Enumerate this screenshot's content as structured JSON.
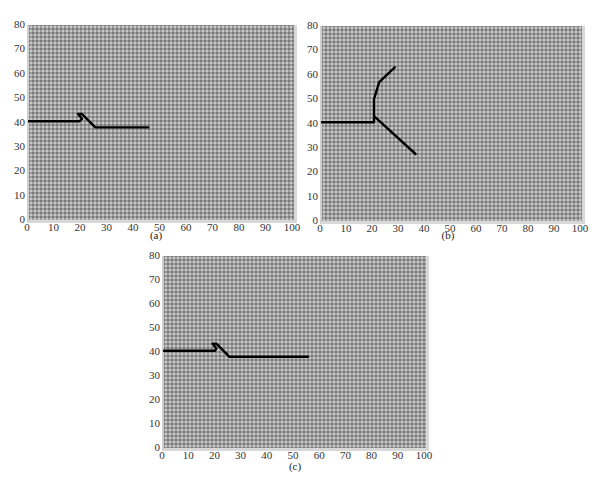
{
  "chart_data": [
    {
      "type": "line",
      "panel": "a",
      "caption": "(a)",
      "xlim": [
        0,
        100
      ],
      "ylim": [
        0,
        80
      ],
      "xticks": [
        "0",
        "10",
        "20",
        "30",
        "40",
        "50",
        "60",
        "70",
        "80",
        "90",
        "100"
      ],
      "yticks": [
        "0",
        "10",
        "20",
        "30",
        "40",
        "50",
        "60",
        "70",
        "80"
      ],
      "grid": "dotted texture background",
      "series": [
        {
          "name": "crack-path",
          "points": [
            [
              0,
              40.5
            ],
            [
              19,
              40.5
            ],
            [
              20,
              41.5
            ],
            [
              18.5,
              43.5
            ],
            [
              20,
              43.5
            ],
            [
              25,
              38
            ],
            [
              45,
              38
            ]
          ]
        }
      ]
    },
    {
      "type": "line",
      "panel": "b",
      "caption": "(b)",
      "xlim": [
        0,
        100
      ],
      "ylim": [
        0,
        80
      ],
      "xticks": [
        "0",
        "10",
        "20",
        "30",
        "40",
        "50",
        "60",
        "70",
        "80",
        "90",
        "100"
      ],
      "yticks": [
        "0",
        "10",
        "20",
        "30",
        "40",
        "50",
        "60",
        "70",
        "80"
      ],
      "grid": "dotted texture background",
      "series": [
        {
          "name": "main-branch",
          "points": [
            [
              0,
              40.5
            ],
            [
              20,
              40.5
            ],
            [
              20,
              50
            ],
            [
              22,
              57
            ],
            [
              28,
              63
            ]
          ]
        },
        {
          "name": "lower-branch",
          "points": [
            [
              20,
              43
            ],
            [
              36,
              27.5
            ]
          ]
        }
      ]
    },
    {
      "type": "line",
      "panel": "c",
      "caption": "(c)",
      "xlim": [
        0,
        100
      ],
      "ylim": [
        0,
        80
      ],
      "xticks": [
        "0",
        "10",
        "20",
        "30",
        "40",
        "50",
        "60",
        "70",
        "80",
        "90",
        "100"
      ],
      "yticks": [
        "0",
        "10",
        "20",
        "30",
        "40",
        "50",
        "60",
        "70",
        "80"
      ],
      "grid": "dotted texture background",
      "series": [
        {
          "name": "crack-path",
          "points": [
            [
              0,
              40.5
            ],
            [
              19.5,
              40.5
            ],
            [
              20,
              41.5
            ],
            [
              18.5,
              43.5
            ],
            [
              20,
              43.5
            ],
            [
              25,
              38
            ],
            [
              55,
              38
            ]
          ]
        }
      ]
    }
  ],
  "captions": {
    "a": "(a)",
    "b": "(b)",
    "c": "(c)"
  },
  "colors": {
    "line": "#000000",
    "plot_bg": "#9d9d9d"
  }
}
